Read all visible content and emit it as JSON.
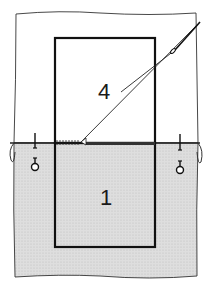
{
  "diagram": {
    "type": "sewing-technique-illustration",
    "labels": {
      "upper_piece": "4",
      "lower_piece": "1"
    },
    "colors": {
      "line": "#1a1a1a",
      "fabric_upper": "#ffffff",
      "fabric_lower": "#d9d9d9",
      "background": "#ffffff"
    },
    "elements": [
      {
        "name": "upper-fabric",
        "desc": "unshaded fabric layer"
      },
      {
        "name": "lower-fabric",
        "desc": "shaded (dotted) fabric layer"
      },
      {
        "name": "pocket-piece-4",
        "label": "4"
      },
      {
        "name": "pocket-piece-1",
        "label": "1"
      },
      {
        "name": "needle-and-thread",
        "desc": "needle drawing thread along fold"
      },
      {
        "name": "pin-left"
      },
      {
        "name": "pin-right"
      },
      {
        "name": "stitches",
        "desc": "hand stitches along fold line"
      }
    ]
  }
}
